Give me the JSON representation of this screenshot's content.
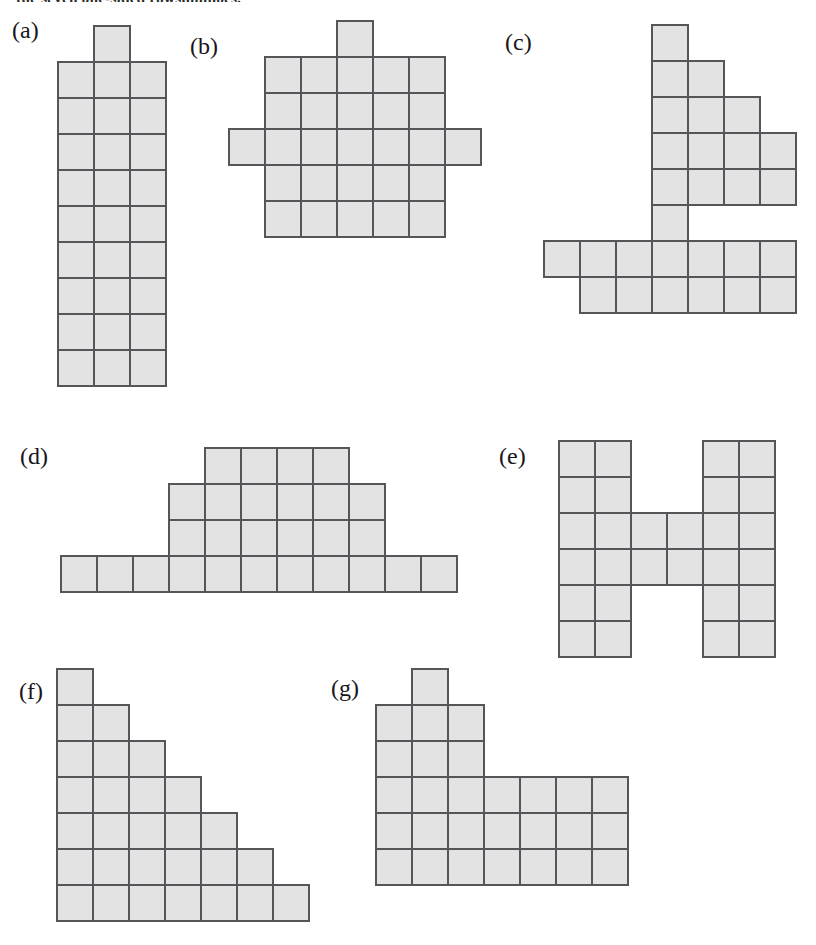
{
  "page": {
    "width": 816,
    "height": 945,
    "background": "#ffffff",
    "top_caption": "the seven one-sided rowshminoes."
  },
  "style": {
    "cell_size": 38,
    "cell_fill": "#e3e3e3",
    "cell_border": "#54565a",
    "cell_border_width": 2,
    "label_color": "#17161a"
  },
  "figure": {
    "type": "polyomino-diagram",
    "shapes": [
      {
        "id": "a",
        "label": "(a)",
        "label_x": 12,
        "label_y": 18,
        "origin_x": 57,
        "origin_y": 25,
        "cols": 3,
        "rows": 10,
        "cell_count": 28,
        "cells": [
          [
            1,
            0
          ],
          [
            0,
            1
          ],
          [
            1,
            1
          ],
          [
            2,
            1
          ],
          [
            0,
            2
          ],
          [
            1,
            2
          ],
          [
            2,
            2
          ],
          [
            0,
            3
          ],
          [
            1,
            3
          ],
          [
            2,
            3
          ],
          [
            0,
            4
          ],
          [
            1,
            4
          ],
          [
            2,
            4
          ],
          [
            0,
            5
          ],
          [
            1,
            5
          ],
          [
            2,
            5
          ],
          [
            0,
            6
          ],
          [
            1,
            6
          ],
          [
            2,
            6
          ],
          [
            0,
            7
          ],
          [
            1,
            7
          ],
          [
            2,
            7
          ],
          [
            0,
            8
          ],
          [
            1,
            8
          ],
          [
            2,
            8
          ],
          [
            0,
            9
          ],
          [
            1,
            9
          ],
          [
            2,
            9
          ]
        ]
      },
      {
        "id": "b",
        "label": "(b)",
        "label_x": 190,
        "label_y": 34,
        "origin_x": 228,
        "origin_y": 20,
        "cols": 7,
        "rows": 6,
        "cell_count": 28,
        "cells": [
          [
            3,
            0
          ],
          [
            1,
            1
          ],
          [
            2,
            1
          ],
          [
            3,
            1
          ],
          [
            4,
            1
          ],
          [
            5,
            1
          ],
          [
            1,
            2
          ],
          [
            2,
            2
          ],
          [
            3,
            2
          ],
          [
            4,
            2
          ],
          [
            5,
            2
          ],
          [
            0,
            3
          ],
          [
            1,
            3
          ],
          [
            2,
            3
          ],
          [
            3,
            3
          ],
          [
            4,
            3
          ],
          [
            5,
            3
          ],
          [
            6,
            3
          ],
          [
            1,
            4
          ],
          [
            2,
            4
          ],
          [
            3,
            4
          ],
          [
            4,
            4
          ],
          [
            5,
            4
          ],
          [
            1,
            5
          ],
          [
            2,
            5
          ],
          [
            3,
            5
          ],
          [
            4,
            5
          ],
          [
            5,
            5
          ]
        ]
      },
      {
        "id": "c",
        "label": "(c)",
        "label_x": 505,
        "label_y": 30,
        "origin_x": 543,
        "origin_y": 24,
        "cols": 7,
        "rows": 8,
        "cell_count": 28,
        "cells": [
          [
            3,
            0
          ],
          [
            3,
            1
          ],
          [
            4,
            1
          ],
          [
            3,
            2
          ],
          [
            4,
            2
          ],
          [
            5,
            2
          ],
          [
            3,
            3
          ],
          [
            4,
            3
          ],
          [
            5,
            3
          ],
          [
            6,
            3
          ],
          [
            3,
            4
          ],
          [
            4,
            4
          ],
          [
            5,
            4
          ],
          [
            6,
            4
          ],
          [
            3,
            5
          ],
          [
            0,
            6
          ],
          [
            1,
            6
          ],
          [
            2,
            6
          ],
          [
            3,
            6
          ],
          [
            4,
            6
          ],
          [
            5,
            6
          ],
          [
            6,
            6
          ],
          [
            1,
            7
          ],
          [
            2,
            7
          ],
          [
            3,
            7
          ],
          [
            4,
            7
          ],
          [
            5,
            7
          ],
          [
            6,
            7
          ]
        ]
      },
      {
        "id": "d",
        "label": "(d)",
        "label_x": 20,
        "label_y": 444,
        "origin_x": 60,
        "origin_y": 447,
        "cols": 11,
        "rows": 4,
        "cell_count": 28,
        "cells": [
          [
            4,
            0
          ],
          [
            5,
            0
          ],
          [
            6,
            0
          ],
          [
            7,
            0
          ],
          [
            3,
            1
          ],
          [
            4,
            1
          ],
          [
            5,
            1
          ],
          [
            6,
            1
          ],
          [
            7,
            1
          ],
          [
            8,
            1
          ],
          [
            3,
            2
          ],
          [
            4,
            2
          ],
          [
            5,
            2
          ],
          [
            6,
            2
          ],
          [
            7,
            2
          ],
          [
            8,
            2
          ],
          [
            0,
            3
          ],
          [
            1,
            3
          ],
          [
            2,
            3
          ],
          [
            3,
            3
          ],
          [
            4,
            3
          ],
          [
            5,
            3
          ],
          [
            6,
            3
          ],
          [
            7,
            3
          ],
          [
            8,
            3
          ],
          [
            9,
            3
          ],
          [
            10,
            3
          ]
        ]
      },
      {
        "id": "e",
        "label": "(e)",
        "label_x": 499,
        "label_y": 444,
        "origin_x": 558,
        "origin_y": 440,
        "cols": 6,
        "rows": 6,
        "cell_count": 28,
        "cells": [
          [
            0,
            0
          ],
          [
            1,
            0
          ],
          [
            4,
            0
          ],
          [
            5,
            0
          ],
          [
            0,
            1
          ],
          [
            1,
            1
          ],
          [
            4,
            1
          ],
          [
            5,
            1
          ],
          [
            0,
            2
          ],
          [
            1,
            2
          ],
          [
            2,
            2
          ],
          [
            3,
            2
          ],
          [
            4,
            2
          ],
          [
            5,
            2
          ],
          [
            0,
            3
          ],
          [
            1,
            3
          ],
          [
            2,
            3
          ],
          [
            3,
            3
          ],
          [
            4,
            3
          ],
          [
            5,
            3
          ],
          [
            0,
            4
          ],
          [
            1,
            4
          ],
          [
            4,
            4
          ],
          [
            5,
            4
          ],
          [
            0,
            5
          ],
          [
            1,
            5
          ],
          [
            4,
            5
          ],
          [
            5,
            5
          ]
        ]
      },
      {
        "id": "f",
        "label": "(f)",
        "label_x": 19,
        "label_y": 679,
        "origin_x": 56,
        "origin_y": 668,
        "cols": 7,
        "rows": 7,
        "cell_count": 28,
        "cells": [
          [
            0,
            0
          ],
          [
            0,
            1
          ],
          [
            1,
            1
          ],
          [
            0,
            2
          ],
          [
            1,
            2
          ],
          [
            2,
            2
          ],
          [
            0,
            3
          ],
          [
            1,
            3
          ],
          [
            2,
            3
          ],
          [
            3,
            3
          ],
          [
            0,
            4
          ],
          [
            1,
            4
          ],
          [
            2,
            4
          ],
          [
            3,
            4
          ],
          [
            4,
            4
          ],
          [
            0,
            5
          ],
          [
            1,
            5
          ],
          [
            2,
            5
          ],
          [
            3,
            5
          ],
          [
            4,
            5
          ],
          [
            5,
            5
          ],
          [
            0,
            6
          ],
          [
            1,
            6
          ],
          [
            2,
            6
          ],
          [
            3,
            6
          ],
          [
            4,
            6
          ],
          [
            5,
            6
          ],
          [
            6,
            6
          ]
        ]
      },
      {
        "id": "g",
        "label": "(g)",
        "label_x": 331,
        "label_y": 676,
        "origin_x": 375,
        "origin_y": 668,
        "cols": 7,
        "rows": 6,
        "cell_count": 28,
        "cells": [
          [
            1,
            0
          ],
          [
            0,
            1
          ],
          [
            1,
            1
          ],
          [
            2,
            1
          ],
          [
            0,
            2
          ],
          [
            1,
            2
          ],
          [
            2,
            2
          ],
          [
            0,
            3
          ],
          [
            1,
            3
          ],
          [
            2,
            3
          ],
          [
            3,
            3
          ],
          [
            4,
            3
          ],
          [
            5,
            3
          ],
          [
            6,
            3
          ],
          [
            0,
            4
          ],
          [
            1,
            4
          ],
          [
            2,
            4
          ],
          [
            3,
            4
          ],
          [
            4,
            4
          ],
          [
            5,
            4
          ],
          [
            6,
            4
          ],
          [
            0,
            5
          ],
          [
            1,
            5
          ],
          [
            2,
            5
          ],
          [
            3,
            5
          ],
          [
            4,
            5
          ],
          [
            5,
            5
          ],
          [
            6,
            5
          ]
        ]
      }
    ]
  }
}
